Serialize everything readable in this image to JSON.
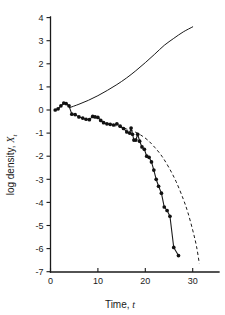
{
  "chart_data": {
    "type": "line",
    "title": "",
    "xlabel": "Time, t",
    "ylabel": "log density, X",
    "ylabel_sub": "t",
    "xlabel_main": "Time,",
    "xlabel_italic": "t",
    "xlim": [
      0,
      35
    ],
    "ylim": [
      -7,
      4
    ],
    "xticks": [
      0,
      10,
      20,
      30
    ],
    "xtick_labels": [
      "0",
      "10",
      "20",
      "30"
    ],
    "yticks": [
      -7,
      -6,
      -5,
      -4,
      -3,
      -2,
      -1,
      0,
      1,
      2,
      3,
      4
    ],
    "ytick_labels": [
      "-7",
      "-6",
      "-5",
      "-4",
      "-3",
      "-2",
      "-1",
      "0",
      "1",
      "2",
      "3",
      "4"
    ],
    "grid": false,
    "legend": "none",
    "series": [
      {
        "name": "observed-data",
        "style": "solid-with-markers",
        "markers": true,
        "x": [
          1.0,
          1.6,
          2.2,
          2.8,
          3.3,
          3.9,
          4.5,
          5.2,
          6.0,
          6.8,
          7.5,
          8.2,
          8.9,
          9.4,
          10.0,
          10.6,
          11.2,
          11.9,
          12.6,
          13.3,
          14.0,
          14.7,
          15.4,
          16.1,
          16.7,
          17.0,
          17.3,
          17.6,
          18.0,
          18.4,
          18.8,
          19.3,
          19.8,
          20.3,
          20.8,
          21.3,
          21.8,
          22.3,
          22.8,
          23.4,
          24.0,
          24.6,
          25.2,
          26.0,
          27.0
        ],
        "y": [
          0.0,
          0.05,
          0.18,
          0.3,
          0.28,
          0.18,
          -0.18,
          -0.2,
          -0.3,
          -0.35,
          -0.4,
          -0.42,
          -0.28,
          -0.3,
          -0.32,
          -0.45,
          -0.55,
          -0.6,
          -0.62,
          -0.65,
          -0.6,
          -0.7,
          -0.8,
          -0.95,
          -1.0,
          -0.78,
          -1.05,
          -1.3,
          -1.3,
          -1.05,
          -1.35,
          -1.6,
          -1.7,
          -2.0,
          -2.05,
          -2.25,
          -2.6,
          -3.0,
          -3.3,
          -3.6,
          -4.2,
          -4.35,
          -4.6,
          -5.95,
          -6.3
        ]
      },
      {
        "name": "upper-model-curve",
        "style": "solid",
        "markers": false,
        "x": [
          4.0,
          6.0,
          8.0,
          10.0,
          12.0,
          14.0,
          16.0,
          18.0,
          20.0,
          22.0,
          24.0,
          26.0,
          28.0,
          30.0
        ],
        "y": [
          0.1,
          0.25,
          0.42,
          0.62,
          0.85,
          1.1,
          1.38,
          1.7,
          2.05,
          2.42,
          2.8,
          3.1,
          3.38,
          3.6
        ]
      },
      {
        "name": "lower-model-curve",
        "style": "dashed",
        "markers": false,
        "x": [
          12.0,
          14.0,
          16.0,
          17.5,
          19.0,
          20.5,
          22.0,
          23.5,
          25.0,
          26.5,
          28.0,
          29.0,
          30.0,
          30.8,
          31.4
        ],
        "y": [
          -0.6,
          -0.7,
          -0.82,
          -0.92,
          -1.08,
          -1.3,
          -1.62,
          -2.0,
          -2.5,
          -3.1,
          -3.85,
          -4.45,
          -5.2,
          -5.9,
          -6.65
        ]
      }
    ]
  }
}
